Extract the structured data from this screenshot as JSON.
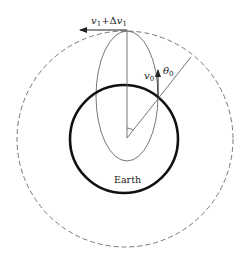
{
  "diagram": {
    "type": "orbital-transfer",
    "labels": {
      "top_velocity_v": "v",
      "top_velocity_sub": "1",
      "top_velocity_plus": "+Δ",
      "top_velocity_v2": "v",
      "top_velocity_sub2": "1",
      "launch_velocity": "v",
      "launch_velocity_sub": "0",
      "launch_angle": "θ",
      "launch_angle_sub": "0",
      "body": "Earth"
    },
    "colors": {
      "earth_outline": "#111111",
      "orbit": "#555555",
      "dashed_orbit": "#777777",
      "lines": "#555555"
    },
    "elements": [
      "outer dashed circular orbit",
      "Earth (thick circle)",
      "elliptical transfer trajectory",
      "vertical radius line from Earth center to apogee",
      "diagonal radius line through launch point",
      "angle arc at Earth center",
      "velocity arrow v0 at launch point",
      "velocity arrow v1+Δv1 at apogee"
    ]
  }
}
